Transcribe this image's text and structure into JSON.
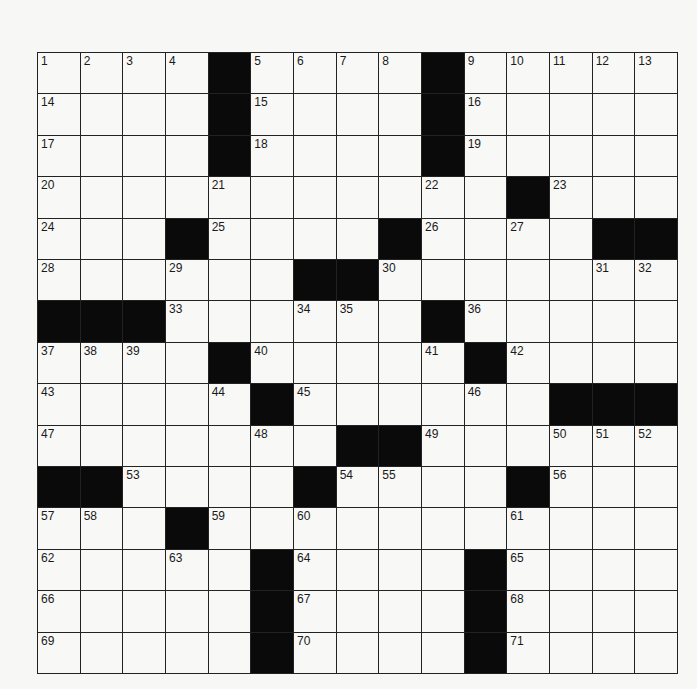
{
  "puzzle": {
    "rows": 15,
    "cols": 15,
    "colors": {
      "block": "#0a0a0a",
      "cell": "#f8f8f6",
      "line": "#222222",
      "number": "#1a1a1a",
      "background": "#f7f7f5"
    },
    "grid": [
      "....#....#.....",
      "....#....#.....",
      "....#....#.....",
      "...........#...",
      "...#....#....##",
      "......##.......",
      "###......#.....",
      "....#.....#....",
      ".....#......###",
      ".......##......",
      "##....#....#...",
      "...#...........",
      ".....#....#....",
      ".....#....#....",
      ".....#....#...."
    ],
    "numbers": [
      {
        "r": 0,
        "c": 0,
        "n": "1"
      },
      {
        "r": 0,
        "c": 1,
        "n": "2"
      },
      {
        "r": 0,
        "c": 2,
        "n": "3"
      },
      {
        "r": 0,
        "c": 3,
        "n": "4"
      },
      {
        "r": 0,
        "c": 5,
        "n": "5"
      },
      {
        "r": 0,
        "c": 6,
        "n": "6"
      },
      {
        "r": 0,
        "c": 7,
        "n": "7"
      },
      {
        "r": 0,
        "c": 8,
        "n": "8"
      },
      {
        "r": 0,
        "c": 10,
        "n": "9"
      },
      {
        "r": 0,
        "c": 11,
        "n": "10"
      },
      {
        "r": 0,
        "c": 12,
        "n": "11"
      },
      {
        "r": 0,
        "c": 13,
        "n": "12"
      },
      {
        "r": 0,
        "c": 14,
        "n": "13"
      },
      {
        "r": 1,
        "c": 0,
        "n": "14"
      },
      {
        "r": 1,
        "c": 5,
        "n": "15"
      },
      {
        "r": 1,
        "c": 10,
        "n": "16"
      },
      {
        "r": 2,
        "c": 0,
        "n": "17"
      },
      {
        "r": 2,
        "c": 5,
        "n": "18"
      },
      {
        "r": 2,
        "c": 10,
        "n": "19"
      },
      {
        "r": 3,
        "c": 0,
        "n": "20"
      },
      {
        "r": 3,
        "c": 4,
        "n": "21"
      },
      {
        "r": 3,
        "c": 9,
        "n": "22"
      },
      {
        "r": 3,
        "c": 12,
        "n": "23"
      },
      {
        "r": 4,
        "c": 0,
        "n": "24"
      },
      {
        "r": 4,
        "c": 4,
        "n": "25"
      },
      {
        "r": 4,
        "c": 9,
        "n": "26"
      },
      {
        "r": 4,
        "c": 11,
        "n": "27"
      },
      {
        "r": 5,
        "c": 0,
        "n": "28"
      },
      {
        "r": 5,
        "c": 3,
        "n": "29"
      },
      {
        "r": 5,
        "c": 8,
        "n": "30"
      },
      {
        "r": 5,
        "c": 13,
        "n": "31"
      },
      {
        "r": 5,
        "c": 14,
        "n": "32"
      },
      {
        "r": 6,
        "c": 3,
        "n": "33"
      },
      {
        "r": 6,
        "c": 6,
        "n": "34"
      },
      {
        "r": 6,
        "c": 7,
        "n": "35"
      },
      {
        "r": 6,
        "c": 10,
        "n": "36"
      },
      {
        "r": 7,
        "c": 0,
        "n": "37"
      },
      {
        "r": 7,
        "c": 1,
        "n": "38"
      },
      {
        "r": 7,
        "c": 2,
        "n": "39"
      },
      {
        "r": 7,
        "c": 5,
        "n": "40"
      },
      {
        "r": 7,
        "c": 9,
        "n": "41"
      },
      {
        "r": 7,
        "c": 11,
        "n": "42"
      },
      {
        "r": 8,
        "c": 0,
        "n": "43"
      },
      {
        "r": 8,
        "c": 4,
        "n": "44"
      },
      {
        "r": 8,
        "c": 6,
        "n": "45"
      },
      {
        "r": 8,
        "c": 10,
        "n": "46"
      },
      {
        "r": 9,
        "c": 0,
        "n": "47"
      },
      {
        "r": 9,
        "c": 5,
        "n": "48"
      },
      {
        "r": 9,
        "c": 9,
        "n": "49"
      },
      {
        "r": 9,
        "c": 12,
        "n": "50"
      },
      {
        "r": 9,
        "c": 13,
        "n": "51"
      },
      {
        "r": 9,
        "c": 14,
        "n": "52"
      },
      {
        "r": 10,
        "c": 2,
        "n": "53"
      },
      {
        "r": 10,
        "c": 7,
        "n": "54"
      },
      {
        "r": 10,
        "c": 8,
        "n": "55"
      },
      {
        "r": 10,
        "c": 12,
        "n": "56"
      },
      {
        "r": 11,
        "c": 0,
        "n": "57"
      },
      {
        "r": 11,
        "c": 1,
        "n": "58"
      },
      {
        "r": 11,
        "c": 4,
        "n": "59"
      },
      {
        "r": 11,
        "c": 6,
        "n": "60"
      },
      {
        "r": 11,
        "c": 11,
        "n": "61"
      },
      {
        "r": 12,
        "c": 0,
        "n": "62"
      },
      {
        "r": 12,
        "c": 3,
        "n": "63"
      },
      {
        "r": 12,
        "c": 6,
        "n": "64"
      },
      {
        "r": 12,
        "c": 11,
        "n": "65"
      },
      {
        "r": 13,
        "c": 0,
        "n": "66"
      },
      {
        "r": 13,
        "c": 6,
        "n": "67"
      },
      {
        "r": 13,
        "c": 11,
        "n": "68"
      },
      {
        "r": 14,
        "c": 0,
        "n": "69"
      },
      {
        "r": 14,
        "c": 6,
        "n": "70"
      },
      {
        "r": 14,
        "c": 11,
        "n": "71"
      }
    ]
  }
}
